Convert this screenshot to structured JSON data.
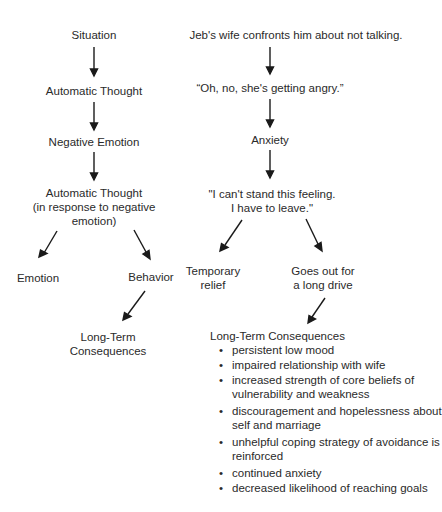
{
  "generic_model": {
    "situation": "Situation",
    "automatic_thought": "Automatic Thought",
    "negative_emotion": "Negative Emotion",
    "automatic_thought_2_line1": "Automatic Thought",
    "automatic_thought_2_line2": "(in response to negative",
    "automatic_thought_2_line3": "emotion)",
    "emotion": "Emotion",
    "behavior": "Behavior",
    "long_term_line1": "Long-Term",
    "long_term_line2": "Consequences"
  },
  "jeb_example": {
    "situation": "Jeb's wife confronts him about not talking.",
    "automatic_thought": "“Oh, no, she's getting angry.”",
    "emotion": "Anxiety",
    "automatic_thought_2_line1": "\"I can't stand this feeling.",
    "automatic_thought_2_line2": "I have to leave.\"",
    "temporary_relief_line1": "Temporary",
    "temporary_relief_line2": "relief",
    "behavior_line1": "Goes out for",
    "behavior_line2": "a long drive",
    "long_term_title": "Long-Term Consequences",
    "consequences": [
      [
        "persistent low mood"
      ],
      [
        "impaired relationship with wife"
      ],
      [
        "increased strength of core beliefs of",
        "vulnerability and weakness"
      ],
      [
        "discouragement and hopelessness about",
        "self and marriage"
      ],
      [
        "unhelpful coping strategy of avoidance is",
        "reinforced"
      ],
      [
        "continued anxiety"
      ],
      [
        "decreased likelihood of reaching goals"
      ]
    ]
  }
}
